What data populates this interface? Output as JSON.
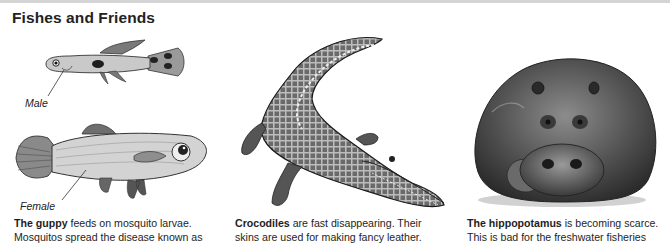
{
  "page": {
    "title": "Fishes and Friends"
  },
  "panels": [
    {
      "id": "guppy",
      "illustrations": [
        {
          "name": "male-guppy",
          "label": "Male"
        },
        {
          "name": "female-guppy",
          "label": "Female"
        }
      ],
      "caption": {
        "bold": "The guppy",
        "line1_rest": " feeds on mosquito larvae.",
        "line2": "Mosquitos spread the disease known as"
      }
    },
    {
      "id": "crocodile",
      "illustrations": [
        {
          "name": "crocodile"
        }
      ],
      "caption": {
        "bold": "Crocodiles",
        "line1_rest": " are fast disappearing. Their",
        "line2": "skins are used for making fancy leather."
      }
    },
    {
      "id": "hippopotamus",
      "illustrations": [
        {
          "name": "hippopotamus"
        }
      ],
      "caption": {
        "bold": "The hippopotamus",
        "line1_rest": " is becoming scarce.",
        "line2": "This is bad for the freshwater fisheries"
      }
    }
  ],
  "colors": {
    "text": "#1e1e1e",
    "rule": "#d4d4d4",
    "background": "#ffffff"
  }
}
